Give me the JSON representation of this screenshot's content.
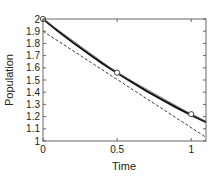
{
  "chart_data": {
    "type": "line",
    "title": "",
    "xlabel": "Time",
    "ylabel": "Population",
    "xlim": [
      0,
      1.1
    ],
    "ylim": [
      1,
      2
    ],
    "grid": false,
    "legend": null,
    "xticks": [
      0,
      0.5,
      1
    ],
    "xtick_labels": [
      "0",
      "0.5",
      "1"
    ],
    "yticks": [
      1,
      1.1,
      1.2,
      1.3,
      1.4,
      1.5,
      1.6,
      1.7,
      1.8,
      1.9,
      2
    ],
    "ytick_labels": [
      "1",
      "1.1",
      "1.2",
      "1.3",
      "1.4",
      "1.5",
      "1.6",
      "1.7",
      "1.8",
      "1.9",
      "2"
    ],
    "series": [
      {
        "name": "exact solution",
        "style": "solid-thick",
        "x": [
          0,
          0.1,
          0.2,
          0.3,
          0.4,
          0.5,
          0.6,
          0.7,
          0.8,
          0.9,
          1.0,
          1.1
        ],
        "y": [
          2.0,
          1.902,
          1.81,
          1.721,
          1.637,
          1.558,
          1.482,
          1.409,
          1.341,
          1.275,
          1.213,
          1.154
        ]
      },
      {
        "name": "approximation",
        "style": "solid-thin",
        "x": [
          0,
          0.5,
          1.0,
          1.1
        ],
        "y": [
          2.0,
          1.56,
          1.22,
          1.16
        ]
      },
      {
        "name": "tangent line",
        "style": "dashed",
        "x": [
          0,
          1.1
        ],
        "y": [
          1.9,
          1.03
        ]
      },
      {
        "name": "sample points",
        "style": "markers-circle",
        "x": [
          0,
          0.5,
          1.0
        ],
        "y": [
          2.0,
          1.56,
          1.22
        ]
      }
    ]
  }
}
